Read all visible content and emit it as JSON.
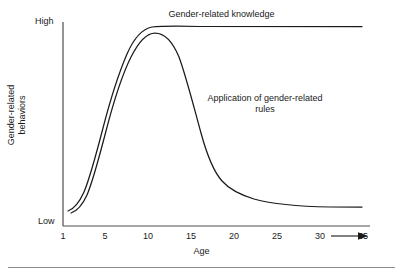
{
  "figure": {
    "y_axis_title": "Gender-related\nbehaviors",
    "x_axis_title": "Age",
    "y_high_label": "High",
    "y_low_label": "Low",
    "annotation_knowledge": "Gender-related knowledge",
    "annotation_rules": "Application of gender-related\nrules",
    "axis_arrow": "right-arrow-icon",
    "line_color": "#1a1a1a",
    "axis_color": "#4d4d4d",
    "rule_color": "#8c8c8c",
    "background": "#ffffff"
  },
  "chart_data": {
    "type": "line",
    "title": "",
    "subtitle": "",
    "xlabel": "Age",
    "ylabel": "Gender-related behaviors",
    "xlim": [
      1,
      37
    ],
    "ylim": [
      0,
      1
    ],
    "ytick_labels": [
      "Low",
      "High"
    ],
    "ytick_values": [
      0,
      1
    ],
    "xtick_labels": [
      "1",
      "5",
      "10",
      "15",
      "20",
      "25",
      "30",
      "35"
    ],
    "xtick_values": [
      1,
      5,
      10,
      15,
      20,
      25,
      30,
      35
    ],
    "grid": false,
    "legend": "none (inline annotations)",
    "annotations": [
      {
        "text": "Gender-related knowledge",
        "x": 22,
        "y": 1.02
      },
      {
        "text": "Application of gender-related rules",
        "x": 23,
        "y": 0.66
      }
    ],
    "series": [
      {
        "name": "Gender-related knowledge",
        "x": [
          1.5,
          2.5,
          3.5,
          4.5,
          5.5,
          6.5,
          7.5,
          8.5,
          9.5,
          10.5,
          12,
          14,
          17,
          20,
          25,
          30,
          35,
          37
        ],
        "y": [
          0.07,
          0.09,
          0.14,
          0.27,
          0.45,
          0.62,
          0.76,
          0.86,
          0.93,
          0.97,
          1.0,
          1.0,
          1.0,
          1.0,
          1.0,
          1.0,
          1.0,
          1.0
        ]
      },
      {
        "name": "Application of gender-related rules",
        "x": [
          1.5,
          2.5,
          3.5,
          4.5,
          5.5,
          6.5,
          7.5,
          8.5,
          9.5,
          10.5,
          11.5,
          13,
          14.5,
          16,
          17.5,
          19,
          21,
          24,
          27,
          31,
          35,
          37
        ],
        "y": [
          0.05,
          0.07,
          0.11,
          0.22,
          0.39,
          0.56,
          0.7,
          0.82,
          0.9,
          0.94,
          0.95,
          0.88,
          0.72,
          0.48,
          0.3,
          0.21,
          0.16,
          0.12,
          0.1,
          0.08,
          0.07,
          0.07
        ]
      }
    ]
  }
}
